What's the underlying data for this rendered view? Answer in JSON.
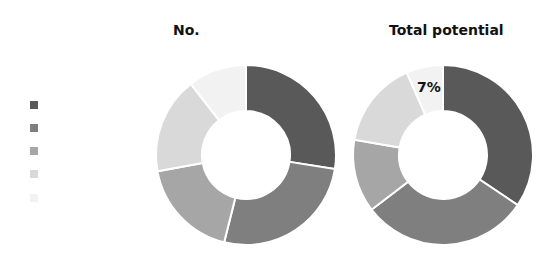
{
  "chart_data": [
    {
      "type": "pie",
      "subtype": "donut",
      "title": "No.",
      "categories": [
        "Series 1",
        "Series 2",
        "Series 3",
        "Series 4",
        "Series 5"
      ],
      "values": [
        27.5,
        26.4,
        18.2,
        17.4,
        10.5
      ],
      "unit": "%",
      "colors": [
        "#595959",
        "#7f7f7f",
        "#a6a6a6",
        "#d9d9d9",
        "#f2f2f2"
      ],
      "data_labels": [],
      "start_angle": 0,
      "direction": "clockwise"
    },
    {
      "type": "pie",
      "subtype": "donut",
      "title": "Total potential",
      "categories": [
        "Series 1",
        "Series 2",
        "Series 3",
        "Series 4",
        "Series 5"
      ],
      "values": [
        34.4,
        30.2,
        13.1,
        15.7,
        6.6
      ],
      "unit": "%",
      "colors": [
        "#595959",
        "#7f7f7f",
        "#a6a6a6",
        "#d9d9d9",
        "#f2f2f2"
      ],
      "data_labels": [
        {
          "index": 4,
          "text": "7%"
        }
      ],
      "start_angle": 0,
      "direction": "clockwise"
    }
  ],
  "legend": {
    "position": "left",
    "entries": [
      {
        "label": "",
        "color": "#595959"
      },
      {
        "label": "",
        "color": "#7f7f7f"
      },
      {
        "label": "",
        "color": "#a6a6a6"
      },
      {
        "label": "",
        "color": "#d9d9d9"
      },
      {
        "label": "",
        "color": "#f2f2f2"
      }
    ]
  },
  "titles": {
    "left": "No.",
    "right": "Total potential"
  },
  "labels": {
    "right_slice5": "7%"
  }
}
